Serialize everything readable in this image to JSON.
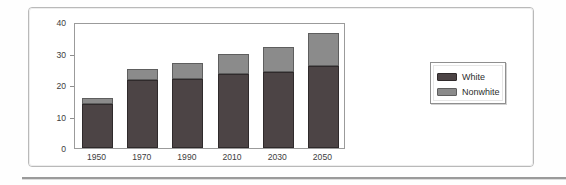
{
  "chart_data": {
    "type": "bar",
    "title": "",
    "subtitle": "",
    "xlabel": "",
    "ylabel": "Age 18-24Pop. (in millions)",
    "categories": [
      "1950",
      "1970",
      "1990",
      "2010",
      "2030",
      "2050"
    ],
    "series": [
      {
        "name": "White",
        "values": [
          14,
          21.5,
          22,
          23.5,
          24,
          26
        ]
      },
      {
        "name": "Nonwhite",
        "values": [
          2,
          3.5,
          5,
          6.5,
          8,
          10.5
        ]
      }
    ],
    "totals": [
      16,
      25,
      27,
      30,
      32,
      36.5
    ],
    "stacked": true,
    "ylim": [
      0,
      40
    ],
    "yticks": [
      0,
      10,
      20,
      30,
      40
    ],
    "ytick_labels": [
      "0",
      "10",
      "20",
      "30",
      "40"
    ],
    "grid": false,
    "legend": {
      "position": "right",
      "entries": [
        {
          "label": "White",
          "color": "#4c4445"
        },
        {
          "label": "Nonwhite",
          "color": "#8b8b8b"
        }
      ]
    },
    "colors": {
      "white": "#4c4445",
      "nonwhite": "#8b8b8b",
      "axis": "#9b9b9b",
      "text": "#3d3d3d"
    }
  }
}
